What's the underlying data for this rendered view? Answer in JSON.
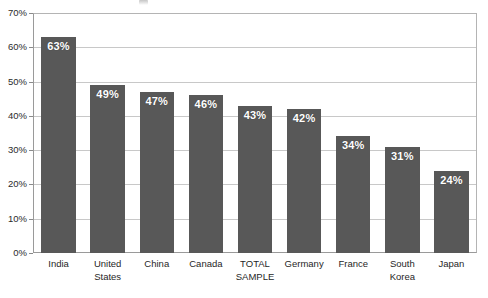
{
  "chart_data": {
    "type": "bar",
    "title": "",
    "subtitle": "",
    "xlabel": "",
    "ylabel": "",
    "categories": [
      "India",
      "United\nStates",
      "China",
      "Canada",
      "TOTAL\nSAMPLE",
      "Germany",
      "France",
      "South\nKorea",
      "Japan"
    ],
    "values": [
      63,
      49,
      47,
      46,
      43,
      42,
      34,
      31,
      24
    ],
    "data_labels": [
      "63%",
      "49%",
      "47%",
      "46%",
      "43%",
      "42%",
      "34%",
      "31%",
      "24%"
    ],
    "ylim": [
      0,
      70
    ],
    "ytick_values": [
      0,
      10,
      20,
      30,
      40,
      50,
      60,
      70
    ],
    "ytick_labels": [
      "0%",
      "10%",
      "20%",
      "30%",
      "40%",
      "50%",
      "60%",
      "70%"
    ],
    "grid": true,
    "grid_axis": "y",
    "legend": false,
    "legend_position": "none",
    "series": [
      {
        "name": "",
        "values": [
          63,
          49,
          47,
          46,
          43,
          42,
          34,
          31,
          24
        ]
      }
    ]
  },
  "colors": {
    "bar": "#585858",
    "gridline": "#c8c8c8",
    "axis": "#9a9a9a",
    "plot_background": "#ffffff",
    "page_background": "#ffffff",
    "value_label": "#ffffff",
    "tick_label": "#2b2b2b"
  }
}
